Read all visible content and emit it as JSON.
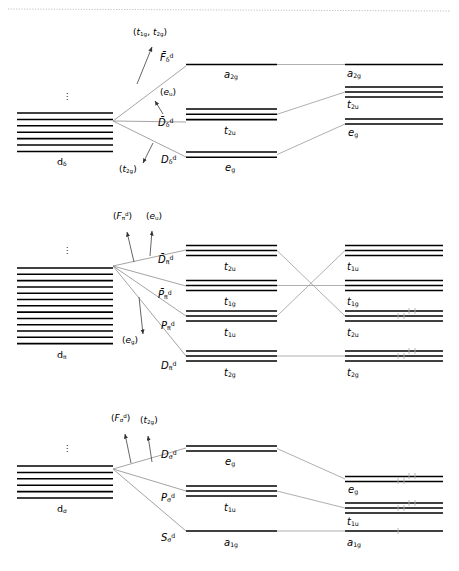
{
  "figure": {
    "type": "energy-level-correlation-diagram",
    "top_rule": "dotted",
    "blocks": [
      {
        "id": "delta",
        "manifold": {
          "label": "dδ",
          "label_html": "d<sub>δ</sub>",
          "lines": 7,
          "ellipsis": "⋮"
        },
        "annotations": [
          {
            "name": "t1g-t2g-annotation",
            "text": "(t₁g, t₂g)",
            "html": "(<i>t</i><sub>1g</sub>, <i>t</i><sub>2g</sub>)"
          },
          {
            "name": "eu-annotation",
            "text": "(eᵤ)",
            "html": "(<i>e</i><sub>u</sub>)"
          },
          {
            "name": "t2g-annotation",
            "text": "(t₂g)",
            "html": "(<i>t</i><sub>2g</sub>)"
          }
        ],
        "terms": [
          {
            "name": "F-delta-d",
            "html": "<i>F̄</i><sub>δ</sub><sup>d</sup>",
            "text": "F̄δd"
          },
          {
            "name": "D-bar-delta-d",
            "html": "<i>D̄</i><sub>δ</sub><sup>d</sup>",
            "text": "D̄δd"
          },
          {
            "name": "D-delta-d",
            "html": "<i>D</i><sub>δ</sub><sup>d</sup>",
            "text": "Dδd"
          }
        ],
        "middle_levels": [
          {
            "label": "a₂g",
            "html": "<i>a</i><sub>2g</sub>",
            "degeneracy": 1
          },
          {
            "label": "t₂u",
            "html": "<i>t</i><sub>2u</sub>",
            "degeneracy": 3
          },
          {
            "label": "e₉",
            "html": "<i>e</i><sub>g</sub>",
            "degeneracy": 2
          }
        ],
        "right_levels": [
          {
            "label": "a₂g",
            "html": "<i>a</i><sub>2g</sub>",
            "degeneracy": 1,
            "electrons": 0
          },
          {
            "label": "t₂u",
            "html": "<i>t</i><sub>2u</sub>",
            "degeneracy": 3,
            "electrons": 0
          },
          {
            "label": "e₉",
            "html": "<i>e</i><sub>g</sub>",
            "degeneracy": 2,
            "electrons": 0
          }
        ]
      },
      {
        "id": "pi",
        "manifold": {
          "label": "dπ",
          "label_html": "d<sub>π</sub>",
          "lines": 13,
          "ellipsis": "⋮"
        },
        "annotations": [
          {
            "name": "F-pi-annotation",
            "text": "(Fπd)",
            "html": "(<i>F</i><sub>π</sub><sup>d</sup>)"
          },
          {
            "name": "eu-annotation",
            "text": "(eᵤ)",
            "html": "(<i>e</i><sub>u</sub>)"
          },
          {
            "name": "eg-annotation",
            "text": "(e₉)",
            "html": "(<i>e</i><sub>g</sub>)"
          }
        ],
        "terms": [
          {
            "name": "D-bar-pi-d",
            "html": "<i>D̄</i><sub>π</sub><sup>d</sup>",
            "text": "D̄πd"
          },
          {
            "name": "P-bar-pi-d",
            "html": "<i>P̄</i><sub>π</sub><sup>d</sup>",
            "text": "P̄πd"
          },
          {
            "name": "P-pi-d",
            "html": "<i>P</i><sub>π</sub><sup>d</sup>",
            "text": "Pπd"
          },
          {
            "name": "D-pi-d",
            "html": "<i>D</i><sub>π</sub><sup>d</sup>",
            "text": "Dπd"
          }
        ],
        "middle_levels": [
          {
            "label": "t₂u",
            "html": "<i>t</i><sub>2u</sub>",
            "degeneracy": 3
          },
          {
            "label": "t₁g",
            "html": "<i>t</i><sub>1g</sub>",
            "degeneracy": 3
          },
          {
            "label": "t₁u",
            "html": "<i>t</i><sub>1u</sub>",
            "degeneracy": 3
          },
          {
            "label": "t₂g",
            "html": "<i>t</i><sub>2g</sub>",
            "degeneracy": 3
          }
        ],
        "right_levels": [
          {
            "label": "t₁u",
            "html": "<i>t</i><sub>1u</sub>",
            "degeneracy": 3,
            "electrons": 0
          },
          {
            "label": "t₁g",
            "html": "<i>t</i><sub>1g</sub>",
            "degeneracy": 3,
            "electrons": 0
          },
          {
            "label": "t₂u",
            "html": "<i>t</i><sub>2u</sub>",
            "degeneracy": 3,
            "electrons": 6
          },
          {
            "label": "t₂g",
            "html": "<i>t</i><sub>2g</sub>",
            "degeneracy": 3,
            "electrons": 6
          }
        ],
        "crossings": "t2u-to-t2u and t1u-to-t1u cross"
      },
      {
        "id": "sigma",
        "manifold": {
          "label": "dσ",
          "label_html": "d<sub>σ</sub>",
          "lines": 6,
          "ellipsis": "⋮"
        },
        "annotations": [
          {
            "name": "F-sigma-annotation",
            "text": "(Fσd)",
            "html": "(<i>F</i><sub>σ</sub><sup>d</sup>)"
          },
          {
            "name": "t2g-annotation",
            "text": "(t₂g)",
            "html": "(<i>t</i><sub>2g</sub>)"
          }
        ],
        "terms": [
          {
            "name": "D-sigma-d",
            "html": "<i>D</i><sub>σ</sub><sup>d</sup>",
            "text": "Dσd"
          },
          {
            "name": "P-sigma-d",
            "html": "<i>P</i><sub>σ</sub><sup>d</sup>",
            "text": "Pσd"
          },
          {
            "name": "S-sigma-d",
            "html": "<i>S</i><sub>σ</sub><sup>d</sup>",
            "text": "Sσd"
          }
        ],
        "middle_levels": [
          {
            "label": "e₉",
            "html": "<i>e</i><sub>g</sub>",
            "degeneracy": 2
          },
          {
            "label": "t₁u",
            "html": "<i>t</i><sub>1u</sub>",
            "degeneracy": 3
          },
          {
            "label": "a₁g",
            "html": "<i>a</i><sub>1g</sub>",
            "degeneracy": 1
          }
        ],
        "right_levels": [
          {
            "label": "e₉",
            "html": "<i>e</i><sub>g</sub>",
            "degeneracy": 2,
            "electrons": 4
          },
          {
            "label": "t₁u",
            "html": "<i>t</i><sub>1u</sub>",
            "degeneracy": 3,
            "electrons": 6
          },
          {
            "label": "a₁g",
            "html": "<i>a</i><sub>1g</sub>",
            "degeneracy": 1,
            "electrons": 2
          }
        ]
      }
    ]
  },
  "colors": {
    "ink": "#000000",
    "connector": "#9a9a9a",
    "rule": "#b9b9b9"
  }
}
